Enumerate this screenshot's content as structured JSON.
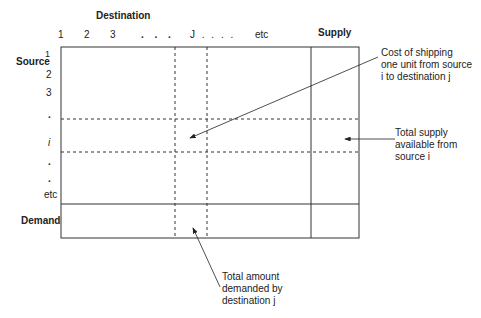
{
  "diagram": {
    "title_destination": "Destination",
    "title_supply": "Supply",
    "title_source": "Source",
    "title_demand": "Demand",
    "destination_labels": [
      "1",
      "2",
      "3",
      ". . .",
      "J . . . .",
      "etc"
    ],
    "source_labels": [
      "1",
      "2",
      "3",
      ".",
      "i",
      ".",
      ".",
      "etc"
    ],
    "annotations": {
      "cost": "Cost of shipping\none unit from source\ni to destination j",
      "supply": "Total supply\navailable from\nsource i",
      "demand": "Total amount\ndemanded by\ndestination j"
    },
    "colors": {
      "line": "#333333",
      "background": "#ffffff"
    }
  }
}
